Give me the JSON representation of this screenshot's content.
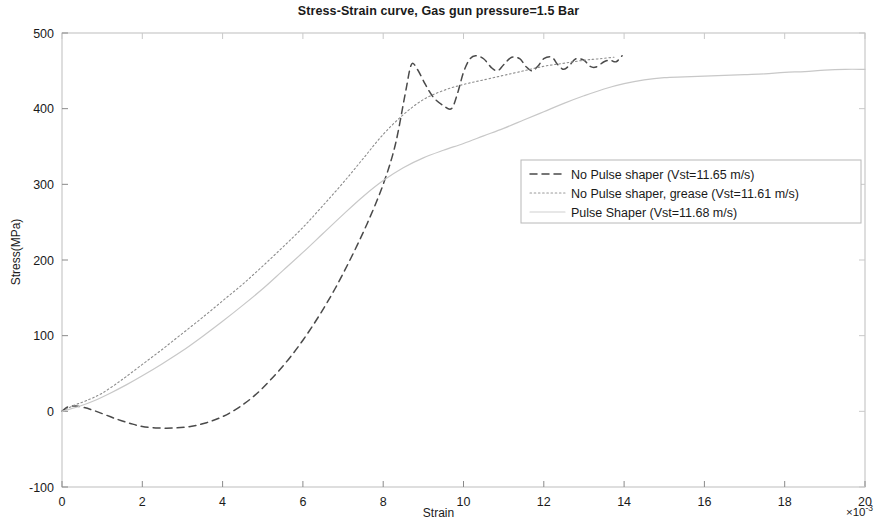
{
  "figure": {
    "title": "Stress-Strain curve, Gas gun pressure=1.5 Bar",
    "xlabel": "Strain",
    "ylabel": "Stress(MPa)",
    "x_exponent_prefix": "×10",
    "x_exponent_power": "-3"
  },
  "chart_data": {
    "type": "line",
    "title": "Stress-Strain curve, Gas gun pressure=1.5 Bar",
    "xlabel": "Strain",
    "ylabel": "Stress(MPa)",
    "x_multiplier": "1e-3",
    "xlim": [
      0,
      20
    ],
    "ylim": [
      -100,
      500
    ],
    "xticks": [
      0,
      2,
      4,
      6,
      8,
      10,
      12,
      14,
      16,
      18,
      20
    ],
    "yticks": [
      -100,
      0,
      100,
      200,
      300,
      400,
      500
    ],
    "grid": false,
    "legend_position": "center-right",
    "series": [
      {
        "name": "No Pulse shaper (Vst=11.65 m/s)",
        "style": "dashed",
        "color": "#4a4a4a",
        "points": [
          [
            0.0,
            0
          ],
          [
            0.15,
            6
          ],
          [
            0.35,
            7
          ],
          [
            0.55,
            5
          ],
          [
            0.8,
            1
          ],
          [
            1.1,
            -5
          ],
          [
            1.4,
            -11
          ],
          [
            1.7,
            -16
          ],
          [
            2.0,
            -20
          ],
          [
            2.4,
            -22
          ],
          [
            2.8,
            -22
          ],
          [
            3.2,
            -20
          ],
          [
            3.6,
            -15
          ],
          [
            4.0,
            -7
          ],
          [
            4.4,
            5
          ],
          [
            4.8,
            21
          ],
          [
            5.2,
            42
          ],
          [
            5.6,
            66
          ],
          [
            6.0,
            94
          ],
          [
            6.4,
            126
          ],
          [
            6.8,
            162
          ],
          [
            7.2,
            203
          ],
          [
            7.6,
            248
          ],
          [
            8.0,
            300
          ],
          [
            8.3,
            352
          ],
          [
            8.55,
            420
          ],
          [
            8.7,
            458
          ],
          [
            8.85,
            452
          ],
          [
            9.05,
            432
          ],
          [
            9.25,
            415
          ],
          [
            9.5,
            404
          ],
          [
            9.7,
            400
          ],
          [
            9.85,
            420
          ],
          [
            10.0,
            448
          ],
          [
            10.15,
            465
          ],
          [
            10.3,
            470
          ],
          [
            10.5,
            466
          ],
          [
            10.7,
            454
          ],
          [
            10.85,
            450
          ],
          [
            11.0,
            458
          ],
          [
            11.2,
            468
          ],
          [
            11.4,
            466
          ],
          [
            11.55,
            456
          ],
          [
            11.7,
            450
          ],
          [
            11.85,
            456
          ],
          [
            12.0,
            466
          ],
          [
            12.2,
            468
          ],
          [
            12.35,
            458
          ],
          [
            12.5,
            452
          ],
          [
            12.65,
            458
          ],
          [
            12.8,
            466
          ],
          [
            13.0,
            464
          ],
          [
            13.15,
            456
          ],
          [
            13.3,
            455
          ],
          [
            13.5,
            462
          ],
          [
            13.65,
            464
          ],
          [
            13.8,
            462
          ],
          [
            13.95,
            470
          ]
        ]
      },
      {
        "name": "No Pulse shaper, grease (Vst=11.61 m/s)",
        "style": "dotted",
        "color": "#8c8c8c",
        "points": [
          [
            0.0,
            0
          ],
          [
            0.3,
            8
          ],
          [
            0.6,
            14
          ],
          [
            1.0,
            24
          ],
          [
            1.5,
            42
          ],
          [
            2.0,
            62
          ],
          [
            2.5,
            82
          ],
          [
            3.0,
            103
          ],
          [
            3.5,
            124
          ],
          [
            4.0,
            146
          ],
          [
            4.5,
            168
          ],
          [
            5.0,
            192
          ],
          [
            5.5,
            217
          ],
          [
            6.0,
            243
          ],
          [
            6.5,
            272
          ],
          [
            7.0,
            302
          ],
          [
            7.5,
            334
          ],
          [
            8.0,
            366
          ],
          [
            8.5,
            392
          ],
          [
            9.0,
            412
          ],
          [
            9.5,
            424
          ],
          [
            10.0,
            432
          ],
          [
            10.5,
            438
          ],
          [
            11.0,
            444
          ],
          [
            11.5,
            450
          ],
          [
            12.0,
            456
          ],
          [
            12.5,
            460
          ],
          [
            13.0,
            464
          ],
          [
            13.4,
            466
          ],
          [
            13.75,
            468
          ]
        ]
      },
      {
        "name": "Pulse Shaper (Vst=11.68 m/s)",
        "style": "solid-light",
        "color": "#c8c8c8",
        "points": [
          [
            0.0,
            0
          ],
          [
            0.4,
            6
          ],
          [
            0.8,
            14
          ],
          [
            1.2,
            24
          ],
          [
            1.6,
            35
          ],
          [
            2.0,
            47
          ],
          [
            2.5,
            63
          ],
          [
            3.0,
            80
          ],
          [
            3.5,
            99
          ],
          [
            4.0,
            119
          ],
          [
            4.5,
            140
          ],
          [
            5.0,
            162
          ],
          [
            5.5,
            186
          ],
          [
            6.0,
            210
          ],
          [
            6.5,
            235
          ],
          [
            7.0,
            260
          ],
          [
            7.5,
            284
          ],
          [
            8.0,
            305
          ],
          [
            8.5,
            322
          ],
          [
            9.0,
            335
          ],
          [
            9.5,
            345
          ],
          [
            10.0,
            354
          ],
          [
            10.5,
            364
          ],
          [
            11.0,
            374
          ],
          [
            11.5,
            385
          ],
          [
            12.0,
            396
          ],
          [
            12.5,
            407
          ],
          [
            13.0,
            417
          ],
          [
            13.5,
            426
          ],
          [
            14.0,
            433
          ],
          [
            14.5,
            438
          ],
          [
            15.0,
            441
          ],
          [
            15.5,
            442
          ],
          [
            16.0,
            443
          ],
          [
            16.5,
            444
          ],
          [
            17.0,
            445
          ],
          [
            17.5,
            446
          ],
          [
            18.0,
            448
          ],
          [
            18.5,
            449
          ],
          [
            19.0,
            451
          ],
          [
            19.5,
            452
          ],
          [
            20.0,
            452
          ]
        ]
      }
    ]
  },
  "legend": {
    "entries": [
      {
        "label": "No Pulse shaper (Vst=11.65 m/s)",
        "style": "dashed",
        "color": "#4a4a4a"
      },
      {
        "label": "No Pulse shaper, grease (Vst=11.61 m/s)",
        "style": "dotted",
        "color": "#9a9a9a"
      },
      {
        "label": "Pulse Shaper (Vst=11.68 m/s)",
        "style": "solid-light",
        "color": "#d0d0d0"
      }
    ]
  },
  "axes": {
    "x_tick_labels": [
      "0",
      "2",
      "4",
      "6",
      "8",
      "10",
      "12",
      "14",
      "16",
      "18",
      "20"
    ],
    "y_tick_labels": [
      "500",
      "400",
      "300",
      "200",
      "100",
      "0",
      "-100"
    ]
  }
}
